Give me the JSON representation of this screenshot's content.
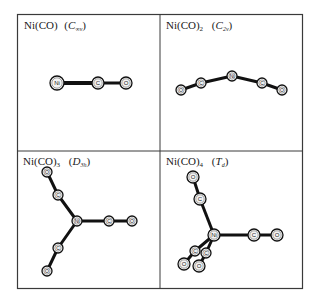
{
  "figure": {
    "panels": [
      {
        "id": "ni-co",
        "formula": "Ni(CO)",
        "formula_sub": "",
        "symmetry_main": "C",
        "symmetry_sub": "∞v",
        "atoms": [
          {
            "label": "Ni",
            "x": 57,
            "y": 83,
            "r": 7
          },
          {
            "label": "C",
            "x": 98,
            "y": 83,
            "r": 6
          },
          {
            "label": "O",
            "x": 126,
            "y": 83,
            "r": 6
          }
        ],
        "bonds": [
          [
            0,
            1,
            4
          ],
          [
            1,
            2,
            3
          ]
        ]
      },
      {
        "id": "ni-co-2",
        "formula": "Ni(CO)",
        "formula_sub": "2",
        "symmetry_main": "C",
        "symmetry_sub": "2v",
        "atoms": [
          {
            "label": "O",
            "x": 181,
            "y": 90,
            "r": 5
          },
          {
            "label": "C",
            "x": 201,
            "y": 83,
            "r": 5
          },
          {
            "label": "Ni",
            "x": 232,
            "y": 76,
            "r": 5
          },
          {
            "label": "C",
            "x": 262,
            "y": 83,
            "r": 5
          },
          {
            "label": "O",
            "x": 282,
            "y": 90,
            "r": 5
          }
        ],
        "bonds": [
          [
            0,
            1,
            3
          ],
          [
            1,
            2,
            3
          ],
          [
            2,
            3,
            3
          ],
          [
            3,
            4,
            3
          ]
        ]
      },
      {
        "id": "ni-co-3",
        "formula": "Ni(CO)",
        "formula_sub": "3",
        "symmetry_main": "D",
        "symmetry_sub": "3h",
        "atoms": [
          {
            "label": "O",
            "x": 47,
            "y": 172,
            "r": 5
          },
          {
            "label": "C",
            "x": 58,
            "y": 195,
            "r": 5
          },
          {
            "label": "Ni",
            "x": 77,
            "y": 221,
            "r": 5
          },
          {
            "label": "C",
            "x": 109,
            "y": 221,
            "r": 5
          },
          {
            "label": "O",
            "x": 132,
            "y": 221,
            "r": 5
          },
          {
            "label": "C",
            "x": 58,
            "y": 248,
            "r": 5
          },
          {
            "label": "O",
            "x": 47,
            "y": 271,
            "r": 5
          }
        ],
        "bonds": [
          [
            0,
            1,
            3
          ],
          [
            1,
            2,
            3
          ],
          [
            2,
            3,
            3
          ],
          [
            3,
            4,
            3
          ],
          [
            2,
            5,
            3
          ],
          [
            5,
            6,
            3
          ]
        ]
      },
      {
        "id": "ni-co-4",
        "formula": "Ni(CO)",
        "formula_sub": "4",
        "symmetry_main": "T",
        "symmetry_sub": "d",
        "atoms": [
          {
            "label": "O",
            "x": 193,
            "y": 177,
            "r": 6
          },
          {
            "label": "C",
            "x": 200,
            "y": 199,
            "r": 6
          },
          {
            "label": "Ni",
            "x": 214,
            "y": 235,
            "r": 6
          },
          {
            "label": "C",
            "x": 254,
            "y": 235,
            "r": 6
          },
          {
            "label": "O",
            "x": 277,
            "y": 235,
            "r": 6
          },
          {
            "label": "C",
            "x": 195,
            "y": 251,
            "r": 5
          },
          {
            "label": "C",
            "x": 206,
            "y": 253,
            "r": 5
          },
          {
            "label": "O",
            "x": 184,
            "y": 264,
            "r": 6
          },
          {
            "label": "O",
            "x": 199,
            "y": 266,
            "r": 6
          }
        ],
        "bonds": [
          [
            0,
            1,
            3
          ],
          [
            1,
            2,
            3
          ],
          [
            2,
            3,
            3
          ],
          [
            3,
            4,
            3
          ],
          [
            2,
            5,
            3
          ],
          [
            2,
            6,
            3
          ],
          [
            5,
            7,
            3
          ],
          [
            6,
            8,
            3
          ]
        ]
      }
    ]
  }
}
